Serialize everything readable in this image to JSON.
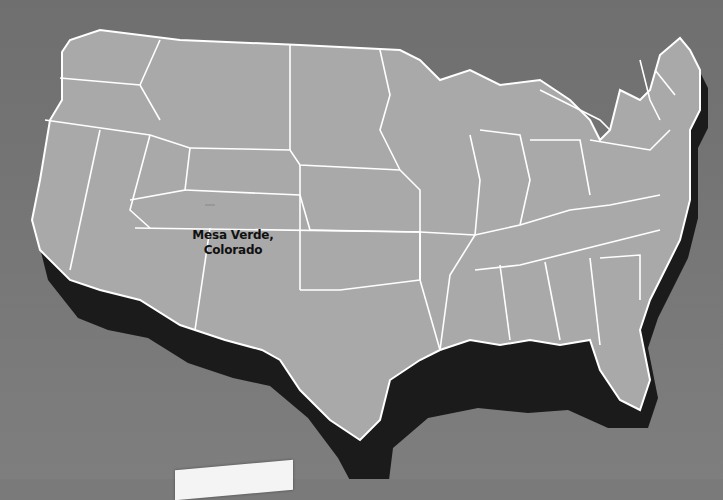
{
  "map": {
    "subject": "United States 3D relief map",
    "label_line1": "Mesa Verde,",
    "label_line2": "Colorado",
    "colors": {
      "background": "#7a7a7a",
      "land": "#a9a9a9",
      "borders": "#ffffff",
      "extrusion": "#1a1a1a",
      "label_text": "#111111"
    }
  }
}
